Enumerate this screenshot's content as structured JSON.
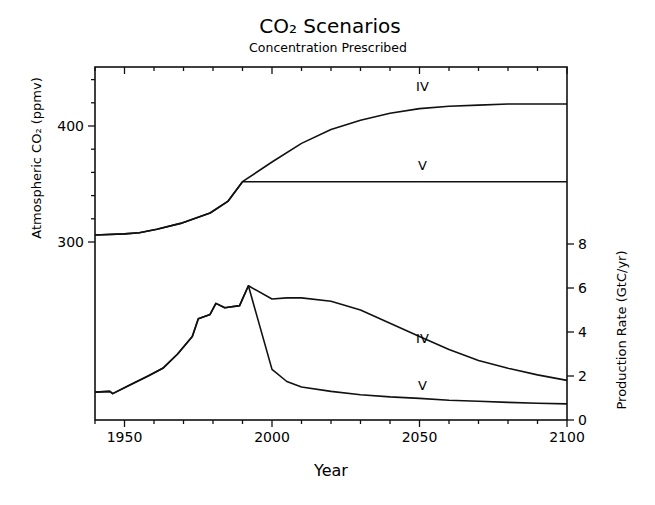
{
  "chart_data": {
    "type": "line",
    "title": "CO₂ Scenarios",
    "subtitle": "Concentration Prescribed",
    "xlabel": "Year",
    "ylabel_left": "Atmospheric CO₂ (ppmv)",
    "ylabel_right": "Production Rate (GtC/yr)",
    "xlim": [
      1940,
      2100
    ],
    "x_ticks": [
      1950,
      2000,
      2050,
      2100
    ],
    "x_minor_step": 10,
    "left_axis": {
      "range": [
        300,
        450
      ],
      "ticks": [
        300,
        400
      ],
      "minor_step": 20
    },
    "right_axis": {
      "range": [
        0,
        8
      ],
      "ticks": [
        0,
        2,
        4,
        6,
        8
      ]
    },
    "grid": false,
    "panels": [
      {
        "name": "Atmospheric CO2",
        "axis": "left",
        "series": [
          {
            "name": "IV",
            "x": [
              1940,
              1950,
              1955,
              1961,
              1969,
              1979,
              1985,
              1990,
              2000,
              2010,
              2020,
              2030,
              2040,
              2050,
              2060,
              2070,
              2080,
              2090,
              2100
            ],
            "values": [
              306,
              307,
              308,
              311,
              316,
              325,
              335,
              352,
              369,
              385,
              397,
              405,
              411,
              415,
              417,
              418,
              419,
              419,
              419
            ]
          },
          {
            "name": "V",
            "x": [
              1940,
              1950,
              1955,
              1961,
              1969,
              1979,
              1985,
              1990,
              2000,
              2050,
              2100
            ],
            "values": [
              306,
              307,
              308,
              311,
              316,
              325,
              335,
              352,
              352,
              352,
              352
            ]
          }
        ]
      },
      {
        "name": "Production Rate",
        "axis": "right",
        "series": [
          {
            "name": "IV",
            "x": [
              1940,
              1945,
              1946,
              1952,
              1958,
              1963,
              1968,
              1973,
              1975,
              1979,
              1981,
              1984,
              1989,
              1992,
              2000,
              2005,
              2010,
              2020,
              2030,
              2040,
              2050,
              2060,
              2070,
              2080,
              2090,
              2100
            ],
            "values": [
              1.27,
              1.3,
              1.2,
              1.6,
              2.0,
              2.35,
              3.0,
              3.8,
              4.6,
              4.8,
              5.3,
              5.1,
              5.2,
              6.1,
              5.5,
              5.55,
              5.55,
              5.4,
              5.0,
              4.4,
              3.8,
              3.2,
              2.7,
              2.35,
              2.05,
              1.8,
              1.6
            ]
          },
          {
            "name": "V",
            "x": [
              1940,
              1945,
              1946,
              1952,
              1958,
              1963,
              1968,
              1973,
              1975,
              1979,
              1981,
              1984,
              1989,
              1992,
              2000,
              2005,
              2010,
              2020,
              2030,
              2040,
              2050,
              2060,
              2070,
              2080,
              2090,
              2100
            ],
            "values": [
              1.27,
              1.3,
              1.2,
              1.6,
              2.0,
              2.35,
              3.0,
              3.8,
              4.6,
              4.8,
              5.3,
              5.1,
              5.2,
              6.1,
              2.3,
              1.75,
              1.5,
              1.3,
              1.15,
              1.05,
              0.98,
              0.9,
              0.85,
              0.8,
              0.76,
              0.73
            ]
          }
        ]
      }
    ],
    "annotations": [
      {
        "text": "IV",
        "x": 2051,
        "y": 430,
        "axis": "left"
      },
      {
        "text": "V",
        "x": 2051,
        "y": 362,
        "axis": "left"
      },
      {
        "text": "IV",
        "x": 2051,
        "y": 3.5,
        "axis": "right"
      },
      {
        "text": "V",
        "x": 2051,
        "y": 1.35,
        "axis": "right"
      }
    ]
  }
}
